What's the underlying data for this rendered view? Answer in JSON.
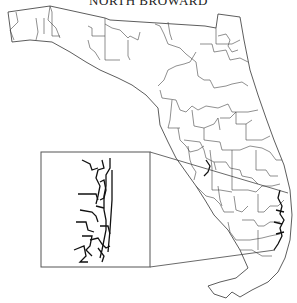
{
  "map": {
    "title": "NORTH BROWARD",
    "region": "Florida",
    "subject": "District boundaries",
    "inset": {
      "label": "North Broward detail",
      "box": {
        "x": 41,
        "y": 152,
        "width": 109,
        "height": 115
      }
    },
    "colors": {
      "background": "#ffffff",
      "boundary": "#444444",
      "inset_detail": "#111111"
    }
  }
}
